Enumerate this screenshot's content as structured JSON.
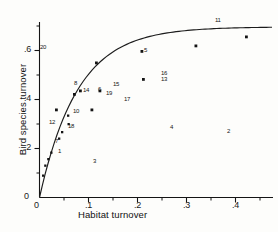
{
  "chart_data": {
    "type": "scatter",
    "title": "",
    "xlabel": "Habitat turnover",
    "ylabel": "Bird species turnover",
    "xlim": [
      0,
      0.45
    ],
    "ylim": [
      0,
      0.72
    ],
    "xticks": [
      0,
      0.1,
      0.2,
      0.3,
      0.4
    ],
    "xtick_labels": [
      "0",
      ".1",
      ".2",
      ".3",
      ".4"
    ],
    "x_minor_ticks": [
      0.05,
      0.15,
      0.25,
      0.35,
      0.45
    ],
    "yticks": [
      0,
      0.2,
      0.4,
      0.6
    ],
    "ytick_labels": [
      "0",
      ".2",
      ".4",
      ".6"
    ],
    "y_minor_ticks": [
      0.1,
      0.3,
      0.5,
      0.7
    ],
    "grid": false,
    "legend": false,
    "points": [
      {
        "label": "",
        "x": 0.007,
        "y": 0.085
      },
      {
        "label": "",
        "x": 0.012,
        "y": 0.125
      },
      {
        "label": "",
        "x": 0.018,
        "y": 0.152
      },
      {
        "label": "",
        "x": 0.024,
        "y": 0.178
      },
      {
        "label": "7",
        "x": 0.04,
        "y": 0.235
      },
      {
        "label": "1",
        "x": 0.046,
        "y": 0.262
      },
      {
        "label": "12",
        "x": 0.033,
        "y": 0.355
      },
      {
        "label": "18",
        "x": 0.058,
        "y": 0.305
      },
      {
        "label": "10",
        "x": 0.057,
        "y": 0.34
      },
      {
        "label": "8",
        "x": 0.07,
        "y": 0.425
      },
      {
        "label": "14",
        "x": 0.082,
        "y": 0.44
      },
      {
        "label": "3",
        "x": 0.105,
        "y": 0.355
      },
      {
        "label": "6",
        "x": 0.122,
        "y": 0.44
      },
      {
        "label": "",
        "x": 0.122,
        "y": 0.555
      },
      {
        "label": "19",
        "x": 0.135,
        "y": 0.43
      },
      {
        "label": "15",
        "x": 0.148,
        "y": 0.455
      },
      {
        "label": "17",
        "x": 0.168,
        "y": 0.405
      },
      {
        "label": "5",
        "x": 0.208,
        "y": 0.605
      },
      {
        "label": "13",
        "x": 0.212,
        "y": 0.49
      },
      {
        "label": "16",
        "x": 0.245,
        "y": 0.5
      },
      {
        "label": "4",
        "x": 0.272,
        "y": 0.285
      },
      {
        "label": "2",
        "x": 0.39,
        "y": 0.275
      },
      {
        "label": "11",
        "x": 0.318,
        "y": 0.625
      },
      {
        "label": "20",
        "x": 0.012,
        "y": 0.6
      },
      {
        "label": "",
        "x": 0.42,
        "y": 0.672
      }
    ],
    "fit_curve": {
      "description": "saturating-rise fitted curve",
      "form": "y = a*(1 - exp(-b*x))",
      "a": 0.7,
      "b": 13.5
    }
  },
  "axes": {
    "x_title": "Habitat turnover",
    "y_title": "Bird species turnover",
    "x_tick_labels": [
      "0",
      ".1",
      ".2",
      ".3",
      ".4"
    ],
    "y_tick_labels": [
      "0",
      ".2",
      ".4",
      ".6"
    ]
  },
  "labels": {
    "n1": "1",
    "n2": "2",
    "n3": "3",
    "n4": "4",
    "n5": "5",
    "n6": "6",
    "n7": "7",
    "n8": "8",
    "n10": "10",
    "n11": "11",
    "n12": "12",
    "n13": "13",
    "n14": "14",
    "n15": "15",
    "n16": "16",
    "n17": "17",
    "n18": "18",
    "n19": "19",
    "n20": "20"
  },
  "style": {
    "marker_color": "#141414",
    "curve_color": "#1c1c1c",
    "axis_color": "#141414",
    "background": "#fdfdfb"
  }
}
